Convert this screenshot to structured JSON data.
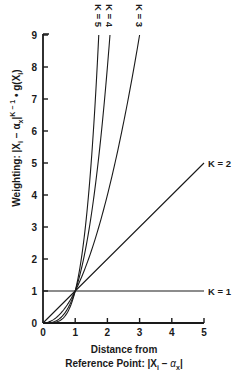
{
  "chart_data": {
    "type": "line",
    "title": "",
    "xlabel": "Distance from Reference Point: |X_i − α_x|",
    "xlabel_line1": "Distance from",
    "xlabel_line2_prefix": "Reference Point: ",
    "ylabel": "Weighting: |X_i − α_x|^(K − 1) • g(X_i)",
    "xlim": [
      0,
      5
    ],
    "ylim": [
      0,
      9
    ],
    "xticks": [
      0,
      1,
      2,
      3,
      4,
      5
    ],
    "yticks": [
      0,
      1,
      2,
      3,
      4,
      5,
      6,
      7,
      8,
      9
    ],
    "grid": false,
    "legend": "inline labels at curve ends",
    "formula": "y = x^(K-1)",
    "series": [
      {
        "name": "K = 1",
        "K": 1,
        "x": [
          0,
          1,
          2,
          3,
          4,
          5
        ],
        "y": [
          1,
          1,
          1,
          1,
          1,
          1
        ],
        "label_pos": "right"
      },
      {
        "name": "K = 2",
        "K": 2,
        "x": [
          0,
          1,
          2,
          3,
          4,
          5
        ],
        "y": [
          0,
          1,
          2,
          3,
          4,
          5
        ],
        "label_pos": "right"
      },
      {
        "name": "K = 3",
        "K": 3,
        "x": [
          0,
          0.5,
          1,
          1.5,
          2,
          2.5,
          3
        ],
        "y": [
          0,
          0.25,
          1,
          2.25,
          4,
          6.25,
          9
        ],
        "label_pos": "top"
      },
      {
        "name": "K = 4",
        "K": 4,
        "x": [
          0,
          0.5,
          1,
          1.5,
          2,
          2.08
        ],
        "y": [
          0,
          0.125,
          1,
          3.375,
          8,
          9
        ],
        "label_pos": "top"
      },
      {
        "name": "K = 5",
        "K": 5,
        "x": [
          0,
          0.5,
          1,
          1.5,
          1.73
        ],
        "y": [
          0,
          0.0625,
          1,
          5.06,
          9
        ],
        "label_pos": "top"
      }
    ]
  },
  "labels": {
    "x_title_line1": "Distance from",
    "x_title_line2": "Reference Point: |X",
    "x_sub_i": "i",
    "x_minus": " − ",
    "x_alpha": "α",
    "x_sub_x": "x",
    "x_close": "|",
    "y_title_a": "Weighting: |X",
    "y_sub_i": "i",
    "y_mid": " − α",
    "y_sub_x": "x",
    "y_bar": "|",
    "y_sup": "K − 1",
    "y_tail": " • g(X",
    "y_sub_i2": "i",
    "y_end": ")"
  }
}
